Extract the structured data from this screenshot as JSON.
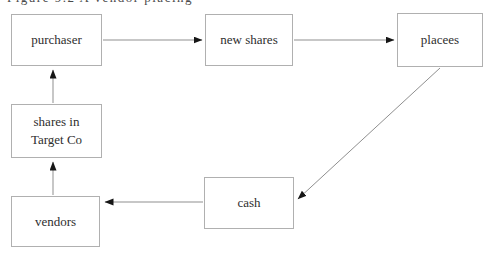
{
  "caption": {
    "text": "Figure 9.2 A vendor placing"
  },
  "diagram": {
    "type": "flow-diagram",
    "nodes": [
      {
        "id": "purchaser",
        "label": "purchaser"
      },
      {
        "id": "new-shares",
        "label": "new shares"
      },
      {
        "id": "placees",
        "label": "placees"
      },
      {
        "id": "shares-in-target-co",
        "label": "shares in\nTarget Co"
      },
      {
        "id": "cash",
        "label": "cash"
      },
      {
        "id": "vendors",
        "label": "vendors"
      }
    ],
    "edges": [
      {
        "from": "purchaser",
        "to": "new-shares"
      },
      {
        "from": "new-shares",
        "to": "placees"
      },
      {
        "from": "placees",
        "to": "cash"
      },
      {
        "from": "cash",
        "to": "vendors"
      },
      {
        "from": "vendors",
        "to": "shares-in-target-co"
      },
      {
        "from": "shares-in-target-co",
        "to": "purchaser"
      }
    ],
    "colors": {
      "background": "#ffffff",
      "box_border": "#b0b0b0",
      "text": "#2e2e2e",
      "line": "#8f8f8f",
      "arrowhead": "#161616"
    }
  }
}
